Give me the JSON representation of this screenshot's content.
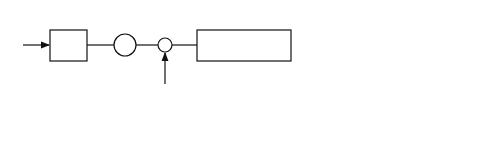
{
  "top": {
    "input": "y[j]",
    "filter": "F(z)",
    "downsample": "p",
    "xhat_label": "x̂[j−d]",
    "multiply": "×",
    "sstar_label": "s*[j−d]",
    "delay": "z⁻ [d/G] G+d",
    "sp": "S/P",
    "code": "c_k^H",
    "z_label": "z_k[n − [d/G]]",
    "w": "W^H",
    "output": "â_k[n − [d/G]]"
  },
  "bottom": {
    "input": "y[j]",
    "filter": "F(z)",
    "xhat_j": "x̂[j]",
    "sp": "S/P",
    "xhat_n": "x̂[n]",
    "code": "c_k^H S_n^H",
    "z_label": "z_k[n]",
    "w": "W^H",
    "output": "â_k[n]"
  }
}
